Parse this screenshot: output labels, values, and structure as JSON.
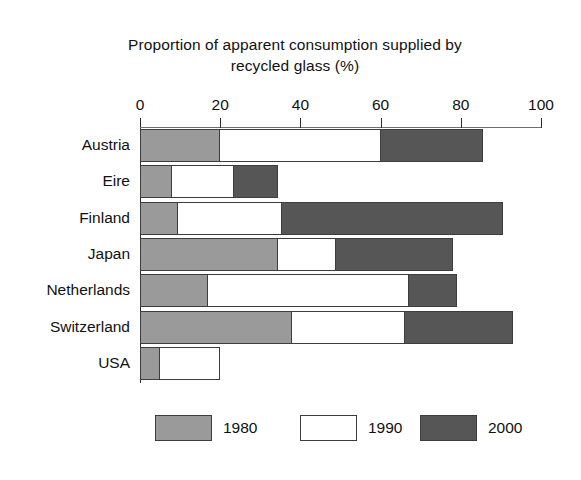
{
  "chart_data": {
    "type": "bar",
    "orientation": "horizontal",
    "stacked": false,
    "title": "Proportion of apparent consumption supplied by recycled glass (%)",
    "title_line1": "Proportion of apparent consumption supplied by",
    "title_line2": "recycled glass (%)",
    "xlabel": "",
    "ylabel": "",
    "xlim": [
      0,
      100
    ],
    "xticks": [
      0,
      20,
      40,
      60,
      80,
      100
    ],
    "xtick_labels": [
      "0",
      "20",
      "40",
      "60",
      "80",
      "100"
    ],
    "grid": false,
    "legend_position": "bottom",
    "categories": [
      "Austria",
      "Eire",
      "Finland",
      "Japan",
      "Netherlands",
      "Switzerland",
      "USA"
    ],
    "series": [
      {
        "name": "1980",
        "color": "#9a9a9a",
        "values": [
          20,
          8,
          9.5,
          34.5,
          17,
          38,
          5
        ]
      },
      {
        "name": "1990",
        "color": "#ffffff",
        "values": [
          60,
          23.5,
          35.5,
          49,
          67,
          66,
          20
        ]
      },
      {
        "name": "2000",
        "color": "#565656",
        "values": [
          85.5,
          34.5,
          90.5,
          78,
          79,
          93,
          0
        ]
      }
    ],
    "note": "Each country shows three separate bars (1980, 1990, 2000) drawn as nested horizontal bands from 0."
  },
  "colors": {
    "series_1980": "#9a9a9a",
    "series_1990": "#ffffff",
    "series_2000": "#565656",
    "axis": "#2b2b2b",
    "outline": "#3d3d3d",
    "background": "#ffffff",
    "text": "#111111"
  },
  "legend": {
    "items": [
      {
        "label": "1980",
        "key": "s1980"
      },
      {
        "label": "1990",
        "key": "s1990"
      },
      {
        "label": "2000",
        "key": "s2000"
      }
    ]
  }
}
